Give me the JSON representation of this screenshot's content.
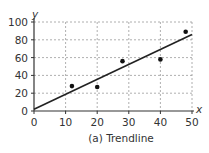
{
  "chart_data": {
    "type": "scatter",
    "title": "",
    "caption": "(a) Trendline",
    "xlabel": "x",
    "ylabel": "y",
    "xlim": [
      0,
      50
    ],
    "ylim": [
      0,
      100
    ],
    "x_ticks": [
      0,
      10,
      20,
      30,
      40,
      50
    ],
    "y_ticks": [
      0,
      20,
      40,
      60,
      80,
      100
    ],
    "grid": true,
    "grid_style": "dashed",
    "legend": null,
    "series": [
      {
        "name": "data",
        "type": "scatter",
        "points": [
          {
            "x": 12,
            "y": 28
          },
          {
            "x": 20,
            "y": 27
          },
          {
            "x": 28,
            "y": 56
          },
          {
            "x": 40,
            "y": 58
          },
          {
            "x": 48,
            "y": 89
          }
        ]
      },
      {
        "name": "trendline",
        "type": "line",
        "points": [
          {
            "x": 0,
            "y": 2
          },
          {
            "x": 50,
            "y": 86
          }
        ]
      }
    ],
    "colors": {
      "points": "#111111",
      "trendline": "#222222",
      "grid": "#9a9a9a",
      "axis": "#333333"
    }
  }
}
